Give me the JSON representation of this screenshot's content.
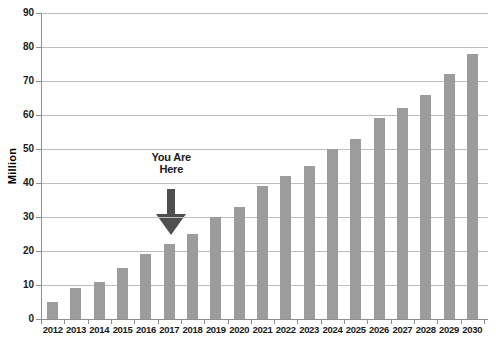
{
  "chart_data": {
    "type": "bar",
    "title": "",
    "xlabel": "",
    "ylabel": "Million",
    "categories": [
      "2012",
      "2013",
      "2014",
      "2015",
      "2016",
      "2017",
      "2018",
      "2019",
      "2020",
      "2021",
      "2022",
      "2023",
      "2024",
      "2025",
      "2026",
      "2027",
      "2028",
      "2029",
      "2030"
    ],
    "values": [
      5,
      9,
      11,
      15,
      19,
      22,
      25,
      30,
      33,
      39,
      42,
      45,
      50,
      53,
      59,
      62,
      66,
      72,
      78
    ],
    "ylim": [
      0,
      90
    ],
    "yticks": [
      0,
      10,
      20,
      30,
      40,
      50,
      60,
      70,
      80,
      90
    ],
    "grid": true,
    "legend": "none",
    "annotation": {
      "lines": [
        "You Are",
        "Here"
      ],
      "target_category": "2017"
    },
    "colors": {
      "bar": "#9c9c9c",
      "gridline": "#bdbdbd",
      "axis": "#8f8f8f",
      "text": "#1a1a1a",
      "arrow": "#4f4f4f",
      "background": "#ffffff"
    }
  }
}
